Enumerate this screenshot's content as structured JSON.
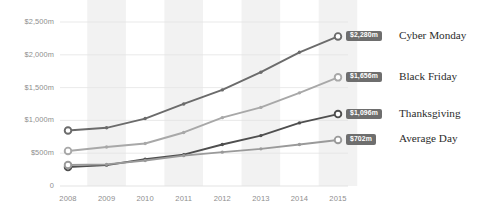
{
  "chart_data": {
    "type": "line",
    "title": "",
    "subtitle": "",
    "xlabel": "",
    "ylabel": "",
    "categories": [
      "2008",
      "2009",
      "2010",
      "2011",
      "2012",
      "2013",
      "2014",
      "2015"
    ],
    "ylim": [
      0,
      2500
    ],
    "y_ticks": [
      0,
      500,
      1000,
      1500,
      2000,
      2500
    ],
    "y_tick_labels": [
      "0",
      "$500m",
      "$1,000m",
      "$1,500m",
      "$2,000m",
      "$2,500m"
    ],
    "grid": true,
    "grid_orientation": "horizontal",
    "alternating_bands": true,
    "legend_position": "right-inline",
    "series": [
      {
        "name": "Cyber Monday",
        "color": "#6b6b6b",
        "end_label": "$2,280m",
        "end_value": 2280,
        "values": [
          846,
          887,
          1028,
          1251,
          1465,
          1735,
          2038,
          2280
        ]
      },
      {
        "name": "Black Friday",
        "color": "#a8a8a8",
        "end_label": "$1,656m",
        "end_value": 1656,
        "values": [
          534,
          595,
          648,
          816,
          1042,
          1198,
          1420,
          1656
        ]
      },
      {
        "name": "Thanksgiving",
        "color": "#4f4f4f",
        "end_label": "$1,096m",
        "end_value": 1096,
        "values": [
          288,
          318,
          407,
          479,
          633,
          768,
          962,
          1096
        ]
      },
      {
        "name": "Average Day",
        "color": "#9a9a9a",
        "end_label": "$702m",
        "end_value": 702,
        "values": [
          320,
          330,
          388,
          463,
          516,
          566,
          632,
          702
        ]
      }
    ]
  },
  "axis": {
    "y_label_color": "#8e8e8e",
    "x_label_color": "#8e8e8e"
  },
  "style": {
    "band_color": "#f2f2f2",
    "gridline_color": "#e3e3e3",
    "badge_bg": "#6e6e6e",
    "badge_text": "#ffffff"
  }
}
